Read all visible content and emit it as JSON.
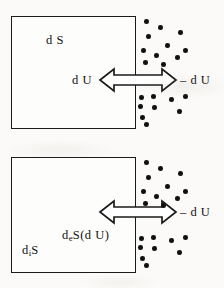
{
  "figure": {
    "background_color": "#fbfaf8",
    "ink_color": "#111111",
    "width": 224,
    "height": 288
  },
  "panels": [
    {
      "id": "panel-top",
      "name": "closed-system-total-entropy",
      "box": {
        "x": 11,
        "y": 16,
        "width": 125,
        "height": 113
      },
      "box_label": {
        "text": "d S",
        "prefix": "d S",
        "sub": "",
        "suffix": "",
        "x": 46,
        "y": 33
      },
      "arrow": {
        "x": 99,
        "y": 68,
        "width": 78,
        "height": 24,
        "style": "hollow-double-headed"
      },
      "labels": [
        {
          "name": "arrow-label-left",
          "text": "d U",
          "prefix": "d U",
          "sub": "",
          "suffix": "",
          "x": 72,
          "y": 73
        },
        {
          "name": "arrow-label-right",
          "text": "– d U",
          "prefix": "– d U",
          "sub": "",
          "suffix": "",
          "x": 180,
          "y": 73
        }
      ],
      "dots": [
        [
          144,
          19
        ],
        [
          158,
          25
        ],
        [
          178,
          30
        ],
        [
          146,
          34
        ],
        [
          165,
          43
        ],
        [
          183,
          48
        ],
        [
          141,
          48
        ],
        [
          154,
          53
        ],
        [
          175,
          55
        ],
        [
          143,
          60
        ],
        [
          161,
          62
        ],
        [
          139,
          95
        ],
        [
          151,
          94
        ],
        [
          169,
          97
        ],
        [
          183,
          94
        ],
        [
          138,
          104
        ],
        [
          152,
          105
        ],
        [
          140,
          115
        ],
        [
          144,
          122
        ],
        [
          177,
          109
        ]
      ]
    },
    {
      "id": "panel-bottom",
      "name": "open-system-entropy-production-and-flow",
      "box": {
        "x": 11,
        "y": 157,
        "width": 125,
        "height": 116
      },
      "box_label": {
        "text": "d i S",
        "prefix": "d",
        "sub": "i",
        "suffix": "S",
        "x": 22,
        "y": 243
      },
      "arrow": {
        "x": 99,
        "y": 200,
        "width": 78,
        "height": 24,
        "style": "hollow-double-headed"
      },
      "labels": [
        {
          "name": "arrow-label-flow",
          "text": "d e S(d U)",
          "prefix": "d",
          "sub": "e",
          "suffix": "S(d U)",
          "x": 62,
          "y": 228
        },
        {
          "name": "arrow-label-right",
          "text": "– d U",
          "prefix": "– d U",
          "sub": "",
          "suffix": "",
          "x": 180,
          "y": 205
        }
      ],
      "dots": [
        [
          144,
          160
        ],
        [
          158,
          166
        ],
        [
          178,
          171
        ],
        [
          146,
          175
        ],
        [
          165,
          184
        ],
        [
          183,
          189
        ],
        [
          141,
          189
        ],
        [
          154,
          194
        ],
        [
          175,
          196
        ],
        [
          143,
          201
        ],
        [
          161,
          203
        ],
        [
          139,
          236
        ],
        [
          151,
          235
        ],
        [
          169,
          238
        ],
        [
          183,
          235
        ],
        [
          138,
          245
        ],
        [
          152,
          246
        ],
        [
          140,
          256
        ],
        [
          144,
          263
        ],
        [
          177,
          250
        ]
      ]
    }
  ],
  "caption": {
    "meaning": "Top: total entropy change d S of a system exchanging energy d U with its surroundings. Bottom: internal entropy production d i S and entropy flow d e S(d U) across the boundary."
  }
}
